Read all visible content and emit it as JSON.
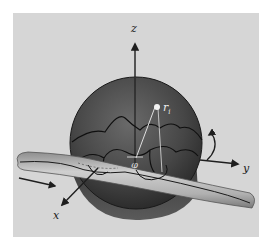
{
  "figure": {
    "labels": {
      "z_axis": "z",
      "y_axis": "y",
      "x_axis": "x",
      "position_vector": "r",
      "position_subscript": "i",
      "azimuth_angle": "φ"
    },
    "colors": {
      "background_panel": "#d6d6d6",
      "sphere_fill": "#3c3c3c",
      "sphere_highlight": "#6a6a6a",
      "tube_fill": "#b9b9b9",
      "axis": "#1e1e1e",
      "chain": "#111111",
      "vector": "#e0e0e0"
    }
  }
}
